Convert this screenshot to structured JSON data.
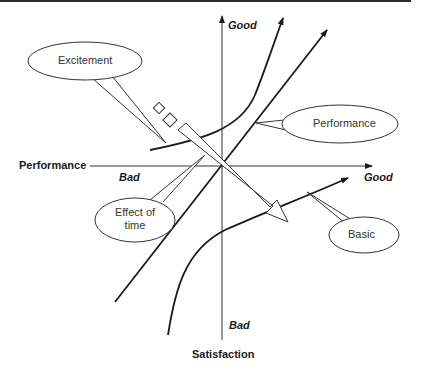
{
  "diagram": {
    "axes": {
      "x_label": "Performance",
      "y_label": "Satisfaction",
      "x_positive": "Good",
      "x_negative": "Bad",
      "y_positive": "Good",
      "y_negative": "Bad"
    },
    "curves": [
      {
        "name": "Excitement",
        "label": "Excitement"
      },
      {
        "name": "Performance",
        "label": "Performance"
      },
      {
        "name": "Basic",
        "label": "Basic"
      }
    ],
    "arrow": {
      "label_line1": "Effect of",
      "label_line2": "time"
    },
    "colors": {
      "line": "#1a1a1a",
      "axis": "#333333",
      "background": "#ffffff"
    }
  }
}
